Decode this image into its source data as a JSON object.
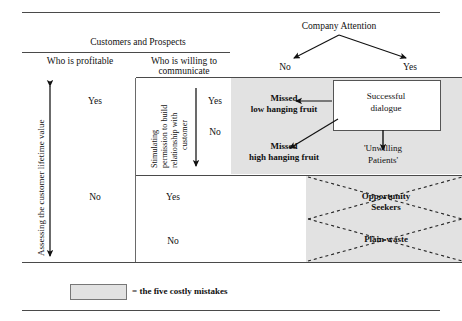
{
  "diagram": {
    "title_company": "Company Attention",
    "company_branches": {
      "left": "No",
      "right": "Yes"
    },
    "customers_header": "Customers and Prospects",
    "col_profitable": "Who is profitable",
    "col_willing_line1": "Who is willing to",
    "col_willing_line2": "communicate",
    "axis_left_label": "Assessing the customer lifetime value",
    "axis_mid_line1": "Stimulating",
    "axis_mid_line2": "permission to build",
    "axis_mid_line3": "relationship with",
    "axis_mid_line4": "customer",
    "profitable_yes": "Yes",
    "profitable_no": "No",
    "willing_upper_yes": "Yes",
    "willing_upper_no": "No",
    "willing_lower_yes": "Yes",
    "willing_lower_no": "No",
    "cells": {
      "missed_low_l1": "Missed",
      "missed_low_l2": "low hanging fruit",
      "missed_high_l1": "Missed",
      "missed_high_l2": "high hanging fruit",
      "successful_l1": "Successful",
      "successful_l2": "dialogue",
      "unwilling_l1": "'Unwilling",
      "unwilling_l2": "Patients'",
      "opportunity_l1": "Opportunity",
      "opportunity_l2": "Seekers",
      "plain_waste": "Plain waste"
    },
    "legend_text": "= the five costly mistakes",
    "colors": {
      "shade": "#e2e2e2",
      "rule": "#4a4a4a",
      "text": "#111111",
      "box_border": "#555555"
    }
  }
}
